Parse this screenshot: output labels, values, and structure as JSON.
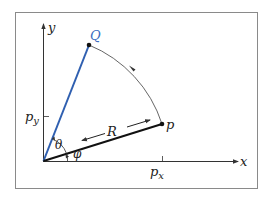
{
  "labels": {
    "y_axis": "y",
    "x_axis": "x",
    "point_Q": "Q",
    "point_p": "p",
    "p_y_main": "p",
    "p_y_sub": "y",
    "p_x_main": "p",
    "p_x_sub": "x",
    "theta": "θ",
    "phi": "φ",
    "R": "R"
  },
  "colors": {
    "frame": "#8a8a8a",
    "axis": "#333333",
    "vector_p": "#111111",
    "vector_Q": "#2f5fb0",
    "label_Q": "#3a6cc0",
    "arc": "#555555",
    "text": "#222222"
  }
}
